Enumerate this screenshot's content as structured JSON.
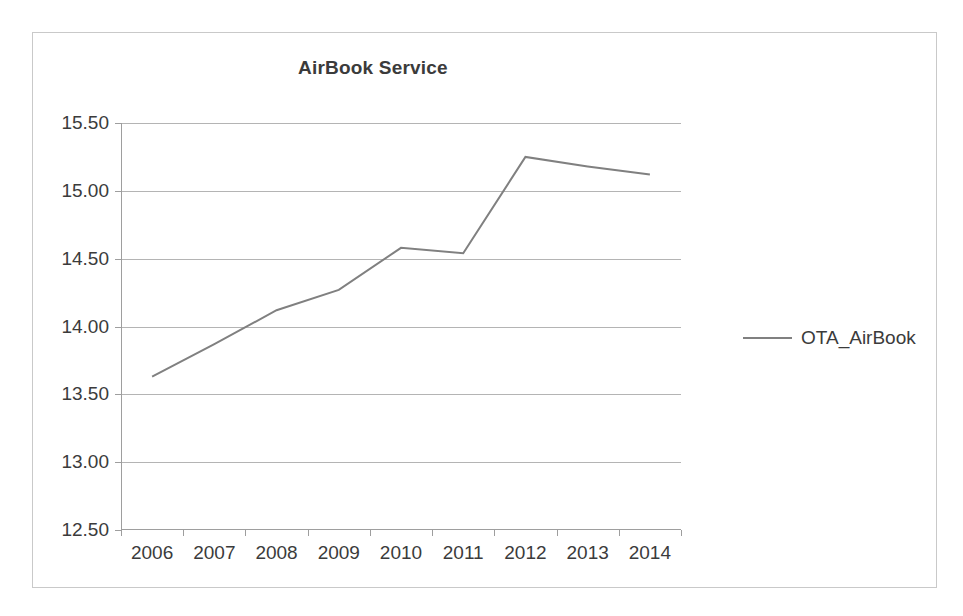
{
  "chart_data": {
    "type": "line",
    "title": "AirBook Service",
    "xlabel": "",
    "ylabel": "",
    "categories": [
      "2006",
      "2007",
      "2008",
      "2009",
      "2010",
      "2011",
      "2012",
      "2013",
      "2014"
    ],
    "series": [
      {
        "name": "OTA_AirBook",
        "color": "#808080",
        "values": [
          13.63,
          13.87,
          14.12,
          14.27,
          14.58,
          14.54,
          15.25,
          15.18,
          15.12
        ]
      }
    ],
    "ylim": [
      12.5,
      15.5
    ],
    "ytick_labels": [
      "15.50",
      "15.00",
      "14.50",
      "14.00",
      "13.50",
      "13.00",
      "12.50"
    ],
    "ytick_values": [
      15.5,
      15.0,
      14.5,
      14.0,
      13.5,
      13.0,
      12.5
    ],
    "grid": true,
    "grid_axis": "y",
    "legend_position": "right",
    "legend_entries": [
      "OTA_AirBook"
    ],
    "markers": false
  },
  "chart": {
    "title": "AirBook Service",
    "legend": {
      "label": "OTA_AirBook"
    }
  }
}
